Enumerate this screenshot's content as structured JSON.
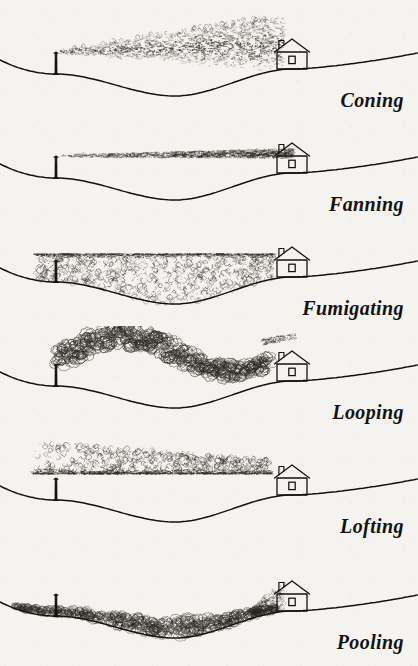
{
  "figure": {
    "background_color": "#f4f3ef",
    "ink_color": "#14120f",
    "smoke_color": "#2b2721",
    "width": 418,
    "height": 666
  },
  "panels": [
    {
      "id": "coning",
      "label": "Coning",
      "label_x": 418,
      "label_y": 118,
      "plume_type": "coning",
      "description": "Plume spreads outward as a widening cone from the stack, stippled texture, drifting slightly upward then flattening downwind",
      "stack_x": 56,
      "house_x": 292,
      "terrain": "hill-left-valley-center-plateau-right",
      "smoke_density": "medium-stipple",
      "order": 1
    },
    {
      "id": "fanning",
      "label": "Fanning",
      "label_x": 418,
      "label_y": 222,
      "plume_type": "fanning",
      "description": "Thin flat horizontal ribbon of smoke spreading laterally with almost no vertical growth",
      "stack_x": 56,
      "house_x": 292,
      "terrain": "hill-left-valley-center-plateau-right",
      "smoke_density": "thin-ribbon",
      "order": 2
    },
    {
      "id": "fumigating",
      "label": "Fumigating",
      "label_x": 418,
      "label_y": 328,
      "plume_type": "fumigating",
      "description": "Smoke held under a sharp flat lid aloft and mixed downward filling the whole valley to ground level",
      "stack_x": 56,
      "house_x": 292,
      "terrain": "hill-left-valley-center-plateau-right",
      "smoke_density": "dense-fill",
      "order": 3
    },
    {
      "id": "looping",
      "label": "Looping",
      "label_x": 418,
      "label_y": 432,
      "plume_type": "looping",
      "description": "Large billowing curls rising and plunging in a wave, dipping to touch the ground mid valley",
      "stack_x": 56,
      "house_x": 292,
      "terrain": "hill-left-valley-center-plateau-right",
      "smoke_density": "large-billows",
      "order": 4
    },
    {
      "id": "lofting",
      "label": "Lofting",
      "label_x": 418,
      "label_y": 536,
      "plume_type": "lofting",
      "description": "Smoke rises upward above a sharp flat bottom edge, nothing mixes downward to the surface",
      "stack_x": 56,
      "house_x": 292,
      "terrain": "hill-left-valley-center-plateau-right",
      "smoke_density": "upward-curls-flat-base",
      "order": 5
    },
    {
      "id": "pooling",
      "label": "Pooling",
      "label_x": 418,
      "label_y": 646,
      "plume_type": "pooling",
      "description": "Smoke settles and collects along the valley floor following the terrain contour",
      "stack_x": 56,
      "house_x": 292,
      "terrain": "hill-left-valley-center-plateau-right",
      "smoke_density": "ground-hugging",
      "order": 6
    }
  ],
  "scene_elements": {
    "stack_name": "smokestack",
    "house_name": "house",
    "ground_name": "terrain-profile"
  }
}
